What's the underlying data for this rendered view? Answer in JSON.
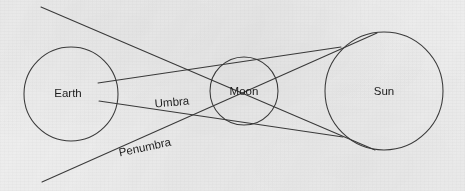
{
  "figure": {
    "kind": "solar-eclipse-shadow-diagram",
    "background_color": "#eeeeee",
    "ink_color": "#3b3b3b",
    "text_color": "#1d1d1d",
    "width": 465,
    "height": 191
  },
  "bodies": [
    {
      "id": "earth",
      "label": "Earth",
      "cx": 71,
      "cy": 94,
      "r": 47,
      "label_x": 68,
      "label_y": 94
    },
    {
      "id": "moon",
      "label": "Moon",
      "cx": 244,
      "cy": 91,
      "r": 34,
      "label_x": 244,
      "label_y": 92
    },
    {
      "id": "sun",
      "label": "Sun",
      "cx": 384,
      "cy": 91,
      "r": 59,
      "label_x": 384,
      "label_y": 92
    }
  ],
  "zone_labels": [
    {
      "id": "umbra",
      "label": "Umbra",
      "x": 172,
      "y": 103,
      "rotation": -5
    },
    {
      "id": "penumbra",
      "label": "Penumbra",
      "x": 145,
      "y": 148,
      "rotation": -12
    }
  ],
  "rays": [
    {
      "id": "umbra-upper",
      "name": "umbra-upper-ray",
      "x1": 98,
      "y1": 83,
      "x2": 341,
      "y2": 47
    },
    {
      "id": "umbra-lower",
      "name": "umbra-lower-ray",
      "x1": 99,
      "y1": 101,
      "x2": 343,
      "y2": 137
    },
    {
      "id": "penumbra-upper",
      "name": "penumbra-upper-ray",
      "x1": 41,
      "y1": 7,
      "x2": 375,
      "y2": 150
    },
    {
      "id": "penumbra-lower",
      "name": "penumbra-lower-ray",
      "x1": 42,
      "y1": 182,
      "x2": 377,
      "y2": 33
    }
  ]
}
